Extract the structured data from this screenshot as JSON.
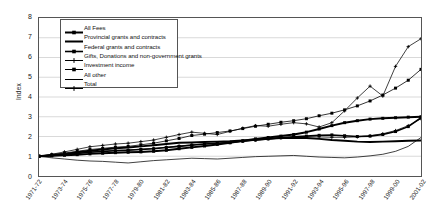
{
  "chart_data": {
    "type": "line",
    "title": "",
    "xlabel": "",
    "ylabel": "Index",
    "ylim": [
      0,
      8
    ],
    "yticks": [
      0,
      1,
      2,
      3,
      4,
      5,
      6,
      7,
      8
    ],
    "grid": true,
    "legend_position": "top-left-inside",
    "x": [
      "1971-72",
      "1972-73",
      "1973-74",
      "1974-75",
      "1975-76",
      "1976-77",
      "1977-78",
      "1978-79",
      "1979-80",
      "1980-81",
      "1981-82",
      "1982-83",
      "1983-84",
      "1984-85",
      "1985-86",
      "1986-87",
      "1987-88",
      "1988-89",
      "1989-90",
      "1990-91",
      "1991-92",
      "1992-93",
      "1993-94",
      "1994-95",
      "1995-96",
      "1996-97",
      "1997-98",
      "1998-99",
      "1999-00",
      "2000-01",
      "2001-02"
    ],
    "xtick_labels": [
      "1971-72",
      "1973-74",
      "1975-76",
      "1977-78",
      "1979-80",
      "1981-82",
      "1983-84",
      "1985-86",
      "1987-88",
      "1989-90",
      "1991-92",
      "1993-94",
      "1995-96",
      "1997-98",
      "1999-00",
      "2001-02"
    ],
    "series": [
      {
        "name": "All Fees",
        "marker": "square",
        "line": "solid-thick",
        "values": [
          1.0,
          1.02,
          1.05,
          1.08,
          1.12,
          1.15,
          1.18,
          1.2,
          1.22,
          1.25,
          1.3,
          1.38,
          1.45,
          1.52,
          1.6,
          1.68,
          1.78,
          1.88,
          1.95,
          2.02,
          2.1,
          2.22,
          2.38,
          2.55,
          2.7,
          2.8,
          2.88,
          2.92,
          2.95,
          2.98,
          3.0
        ]
      },
      {
        "name": "Provincial grants and contracts",
        "marker": "none",
        "line": "solid-thick",
        "values": [
          1.0,
          1.06,
          1.12,
          1.2,
          1.28,
          1.34,
          1.4,
          1.44,
          1.5,
          1.56,
          1.62,
          1.68,
          1.7,
          1.72,
          1.74,
          1.76,
          1.8,
          1.84,
          1.88,
          1.92,
          1.94,
          1.92,
          1.88,
          1.82,
          1.78,
          1.74,
          1.72,
          1.74,
          1.76,
          1.78,
          1.8
        ]
      },
      {
        "name": "Federal grants and contracts",
        "marker": "square",
        "line": "solid-medium",
        "values": [
          1.0,
          1.04,
          1.08,
          1.14,
          1.2,
          1.24,
          1.28,
          1.3,
          1.34,
          1.38,
          1.44,
          1.5,
          1.56,
          1.62,
          1.66,
          1.7,
          1.76,
          1.82,
          1.88,
          1.94,
          1.98,
          2.02,
          2.06,
          2.08,
          2.04,
          2.0,
          2.02,
          2.1,
          2.25,
          2.5,
          2.95
        ]
      },
      {
        "name": "Gifts, Donations and non-government grants",
        "marker": "plus",
        "line": "thin",
        "values": [
          1.0,
          1.1,
          1.22,
          1.35,
          1.48,
          1.55,
          1.62,
          1.66,
          1.74,
          1.82,
          1.96,
          2.1,
          2.22,
          2.16,
          2.1,
          2.26,
          2.42,
          2.55,
          2.52,
          2.62,
          2.7,
          2.64,
          2.48,
          2.7,
          3.3,
          3.95,
          4.55,
          4.05,
          5.55,
          6.55,
          6.95
        ]
      },
      {
        "name": "Investment income",
        "marker": "square",
        "line": "thin-marker",
        "values": [
          1.0,
          1.08,
          1.16,
          1.25,
          1.34,
          1.4,
          1.46,
          1.5,
          1.58,
          1.66,
          1.78,
          1.9,
          2.05,
          2.12,
          2.2,
          2.28,
          2.4,
          2.52,
          2.62,
          2.72,
          2.8,
          2.9,
          3.05,
          3.18,
          3.35,
          3.55,
          3.8,
          4.1,
          4.45,
          4.85,
          5.4
        ]
      },
      {
        "name": "All other",
        "marker": "none",
        "line": "thin-plain",
        "values": [
          1.0,
          0.92,
          0.86,
          0.8,
          0.76,
          0.74,
          0.7,
          0.66,
          0.72,
          0.78,
          0.82,
          0.86,
          0.9,
          0.88,
          0.86,
          0.9,
          0.94,
          0.98,
          1.0,
          1.02,
          1.04,
          1.0,
          0.96,
          0.94,
          0.92,
          0.96,
          1.02,
          1.1,
          1.25,
          1.5,
          1.95
        ]
      },
      {
        "name": "Total",
        "marker": "plus",
        "line": "thin",
        "values": [
          1.0,
          1.05,
          1.1,
          1.16,
          1.22,
          1.26,
          1.3,
          1.32,
          1.36,
          1.4,
          1.46,
          1.52,
          1.58,
          1.62,
          1.66,
          1.7,
          1.76,
          1.82,
          1.88,
          1.92,
          1.96,
          1.98,
          1.98,
          1.96,
          1.96,
          1.98,
          2.04,
          2.14,
          2.3,
          2.55,
          2.9
        ]
      }
    ]
  },
  "legend": {
    "items": [
      {
        "label": "All Fees"
      },
      {
        "label": "Provincial grants and contracts"
      },
      {
        "label": "Federal grants and contracts"
      },
      {
        "label": "Gifts, Donations and non-government grants"
      },
      {
        "label": "Investment income"
      },
      {
        "label": "All other"
      },
      {
        "label": "Total"
      }
    ]
  }
}
